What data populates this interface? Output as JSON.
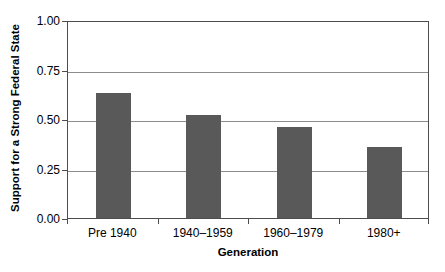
{
  "chart_data": {
    "type": "bar",
    "title": "",
    "subtitle": "",
    "xlabel": "Generation",
    "ylabel": "Support for a Strong Federal State",
    "categories": [
      "Pre 1940",
      "1940–1959",
      "1960–1979",
      "1980+"
    ],
    "values": [
      0.63,
      0.52,
      0.46,
      0.36
    ],
    "series": [
      {
        "name": "Support for a Strong Federal State",
        "values": [
          0.63,
          0.52,
          0.46,
          0.36
        ]
      }
    ],
    "ylim": [
      0.0,
      1.0
    ],
    "ytick_labels": [
      "1.00",
      "0.75",
      "0.50",
      "0.25",
      "0.00"
    ],
    "ytick_values": [
      1.0,
      0.75,
      0.5,
      0.25,
      0.0
    ],
    "grid": true,
    "grid_axis": "y",
    "legend": false,
    "legend_position": "none",
    "bar_color": "#595959",
    "grid_color": "#8c8c8c",
    "frame_color": "#4d4d4d",
    "background_color": "#ffffff",
    "annotations": []
  }
}
